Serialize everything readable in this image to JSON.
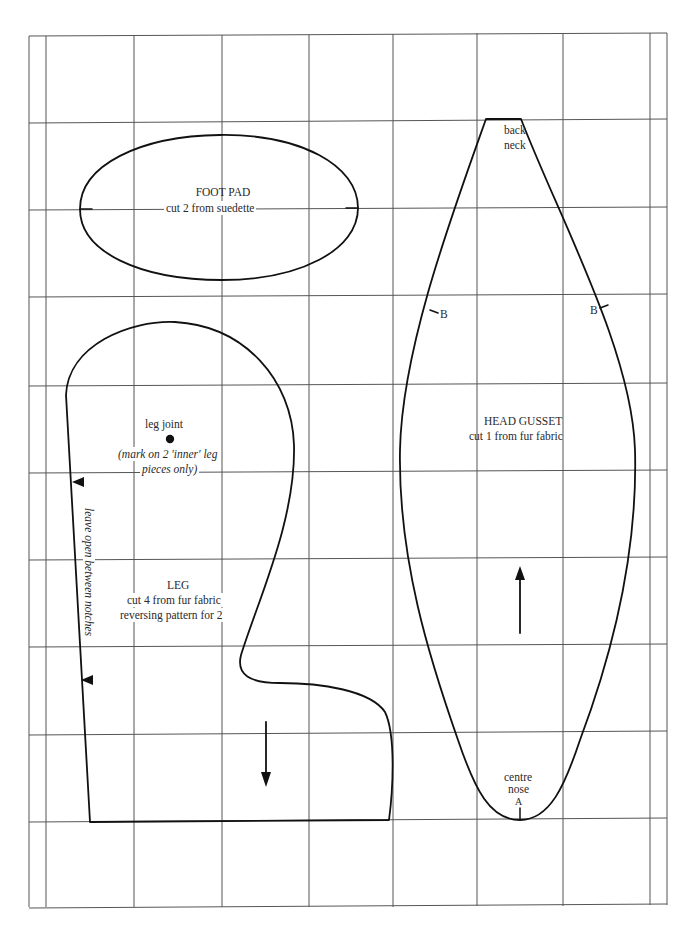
{
  "pattern": {
    "grid": {
      "color": "#555555",
      "verticals": [
        29,
        46,
        134,
        222,
        309,
        393,
        477,
        563,
        650,
        667
      ],
      "horizontals": [
        36,
        123,
        210,
        297,
        386,
        472,
        559,
        646,
        734,
        820,
        907
      ]
    },
    "outline_color": "#111111",
    "pieces": {
      "foot_pad": {
        "title": "FOOT PAD",
        "instruction": "cut 2 from suedette"
      },
      "leg": {
        "joint_label": "leg joint",
        "joint_note_line1": "(mark on 2 'inner' leg",
        "joint_note_line2": "pieces only)",
        "opening_note": "leave open between notches",
        "title": "LEG",
        "instruction_line1": "cut 4 from fur fabric",
        "instruction_line2": "reversing pattern for 2",
        "grain_arrow": "down"
      },
      "head_gusset": {
        "top_label_line1": "back",
        "top_label_line2": "neck",
        "notch_left": "B",
        "notch_right": "B",
        "title": "HEAD GUSSET",
        "instruction": "cut 1 from fur fabric",
        "bottom_label_line1": "centre",
        "bottom_label_line2": "nose",
        "notch_bottom": "A",
        "grain_arrow": "up"
      }
    }
  }
}
